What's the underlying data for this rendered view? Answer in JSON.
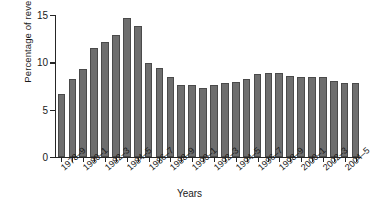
{
  "chart_data": {
    "type": "bar",
    "title": "",
    "xlabel": "Years",
    "ylabel": "Percentage of revenue",
    "ylim": [
      0,
      15
    ],
    "yticks": [
      0,
      5,
      10,
      15
    ],
    "ytick_labels": [
      "0",
      "5",
      "10",
      "15"
    ],
    "grid": false,
    "legend": null,
    "bar_color": "#6e6e6e",
    "bar_edge_color": "#4a4a4a",
    "categories": [
      "1978–9",
      "1979–80",
      "1980–1",
      "1981–2",
      "1982–3",
      "1983–4",
      "1984–5",
      "1985–6",
      "1986–7",
      "1987–8",
      "1988–9",
      "1989–90",
      "1990–1",
      "1991–2",
      "1992–3",
      "1993–4",
      "1994–5",
      "1995–6",
      "1996–7",
      "1997–8",
      "1998–9",
      "1999–2000",
      "2000–1",
      "2001–2",
      "2002–3",
      "2003–4",
      "2004–5",
      "2005–6"
    ],
    "values": [
      6.7,
      8.2,
      9.3,
      11.5,
      12.2,
      12.9,
      14.7,
      13.8,
      9.9,
      9.4,
      8.4,
      7.6,
      7.6,
      7.3,
      7.6,
      7.8,
      7.9,
      8.2,
      8.8,
      8.9,
      8.9,
      8.6,
      8.5,
      8.5,
      8.4,
      8.0,
      7.8,
      7.8
    ],
    "xtick_labels_visible": [
      "1978–9",
      "1980–1",
      "1982–3",
      "1984–5",
      "1986–7",
      "1988–9",
      "1990–1",
      "1992–3",
      "1994–5",
      "1996–7",
      "1998–9",
      "2000–1",
      "2002–3",
      "2004–5"
    ],
    "xtick_label_indices": [
      0,
      2,
      4,
      6,
      8,
      10,
      12,
      14,
      16,
      18,
      20,
      22,
      24,
      26
    ]
  }
}
